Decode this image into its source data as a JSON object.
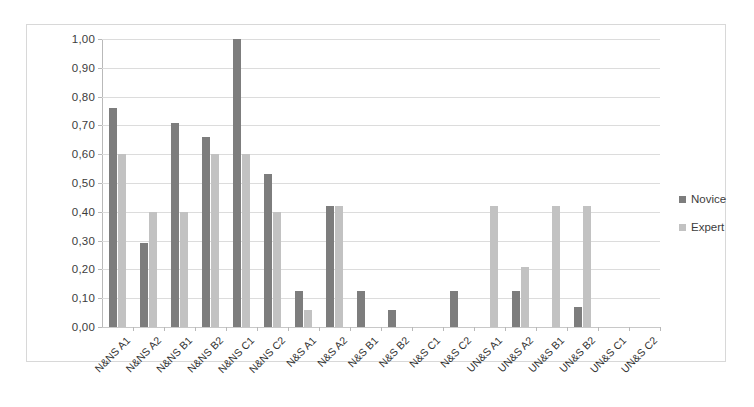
{
  "chart_data": {
    "type": "bar",
    "title": "",
    "xlabel": "",
    "ylabel": "",
    "ylim": [
      0,
      1
    ],
    "grid": true,
    "legend_position": "right",
    "decimal_separator": ",",
    "ytick_labels": [
      "1,00",
      "0,90",
      "0,80",
      "0,70",
      "0,60",
      "0,50",
      "0,40",
      "0,30",
      "0,20",
      "0,10",
      "0,00"
    ],
    "ytick_values": [
      1.0,
      0.9,
      0.8,
      0.7,
      0.6,
      0.5,
      0.4,
      0.3,
      0.2,
      0.1,
      0.0
    ],
    "categories": [
      "N&NS A1",
      "N&NS A2",
      "N&NS B1",
      "N&NS B2",
      "N&NS C1",
      "N&NS C2",
      "N&S A1",
      "N&S A2",
      "N&S B1",
      "N&S B2",
      "N&S C1",
      "N&S C2",
      "UN&S A1",
      "UN&S A2",
      "UN&S B1",
      "UN&S B2",
      "UN&S C1",
      "UN&S C2"
    ],
    "series": [
      {
        "name": "Novice",
        "color": "#7d7d7d",
        "values": [
          0.76,
          0.29,
          0.71,
          0.66,
          1.0,
          0.53,
          0.125,
          0.42,
          0.125,
          0.06,
          0.0,
          0.125,
          0.0,
          0.125,
          0.0,
          0.07,
          0.0,
          0.0
        ]
      },
      {
        "name": "Expert",
        "color": "#c2c2c2",
        "values": [
          0.6,
          0.4,
          0.4,
          0.6,
          0.6,
          0.4,
          0.06,
          0.42,
          0.0,
          0.0,
          0.0,
          0.0,
          0.42,
          0.21,
          0.42,
          0.42,
          0.0,
          0.0
        ]
      }
    ]
  },
  "legend": {
    "items": [
      {
        "label": "Novice",
        "color": "#7d7d7d"
      },
      {
        "label": "Expert",
        "color": "#c2c2c2"
      }
    ]
  }
}
